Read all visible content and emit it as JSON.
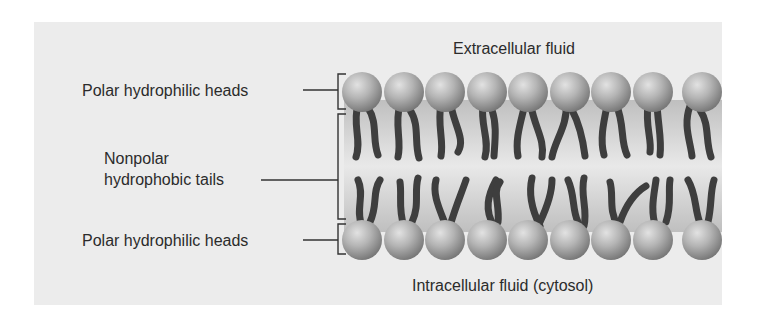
{
  "diagram": {
    "type": "phospholipid-bilayer",
    "labels": {
      "extracellular": "Extracellular fluid",
      "intracellular": "Intracellular fluid (cytosol)",
      "top_heads": "Polar hydrophilic heads",
      "tails_line1": "Nonpolar",
      "tails_line2": "hydrophobic tails",
      "bottom_heads": "Polar hydrophilic heads"
    },
    "heads_per_row": 9,
    "colors": {
      "panel": "#ececec",
      "head_light": "#d9d9d9",
      "head_dark": "#7a7a7a",
      "tail": "#3e3e3e",
      "leader_line": "#333333"
    }
  }
}
